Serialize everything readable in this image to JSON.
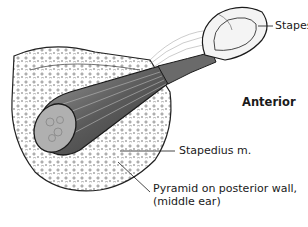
{
  "diagram": {
    "labels": {
      "stapes": "Stapes",
      "anterior": "Anterior",
      "stapedius": "Stapedius m.",
      "pyramid_line1": "Pyramid on posterior wall,",
      "pyramid_line2": "(middle ear)"
    },
    "colors": {
      "ink": "#1a1a1a",
      "shade": "#8a8a8a",
      "background": "#ffffff"
    }
  }
}
